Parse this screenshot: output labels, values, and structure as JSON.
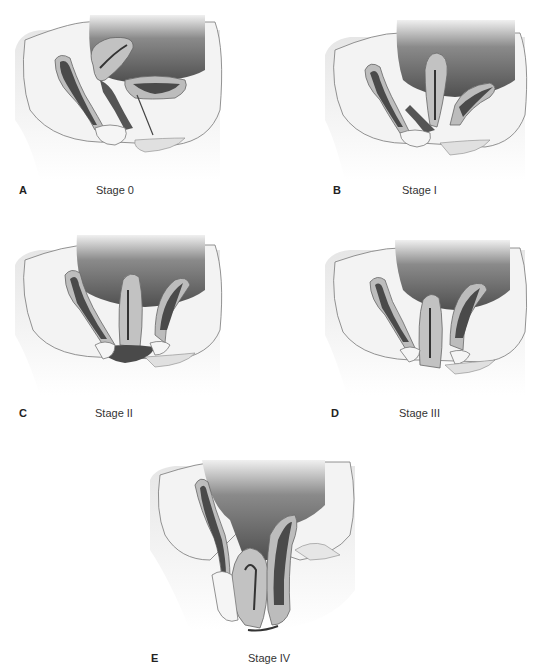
{
  "figure": {
    "panels": [
      {
        "letter": "A",
        "stage": "Stage 0"
      },
      {
        "letter": "B",
        "stage": "Stage I"
      },
      {
        "letter": "C",
        "stage": "Stage II"
      },
      {
        "letter": "D",
        "stage": "Stage III"
      },
      {
        "letter": "E",
        "stage": "Stage IV"
      }
    ],
    "colors": {
      "skin": "#e2e2e2",
      "body_light": "#f2f2f2",
      "cavity_dark": "#6a6a6a",
      "organ_wall": "#bdbdbd",
      "lumen_dark": "#4a4a4a",
      "outline": "#555555"
    }
  }
}
